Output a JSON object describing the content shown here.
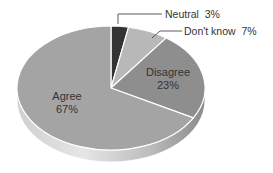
{
  "chart_data": {
    "type": "pie",
    "title": "",
    "three_d": true,
    "start_angle": "12 o'clock",
    "direction": "clockwise",
    "slices": [
      {
        "label": "Neutral",
        "value": 3,
        "value_label": "3%",
        "color": "#333333",
        "label_position": "outside-callout"
      },
      {
        "label": "Don't know",
        "value": 7,
        "value_label": "7%",
        "color": "#b8b8b8",
        "label_position": "outside-callout"
      },
      {
        "label": "Disagree",
        "value": 23,
        "value_label": "23%",
        "color": "#8e8e8e",
        "label_position": "inside"
      },
      {
        "label": "Agree",
        "value": 67,
        "value_label": "67%",
        "color": "#a4a4a4",
        "label_position": "inside"
      }
    ],
    "legend": "none"
  },
  "labels": {
    "neutral": "Neutral  3%",
    "dontknow": "Don't know  7%",
    "disagree_name": "Disagree",
    "disagree_pct": "23%",
    "agree_name": "Agree",
    "agree_pct": "67%"
  }
}
